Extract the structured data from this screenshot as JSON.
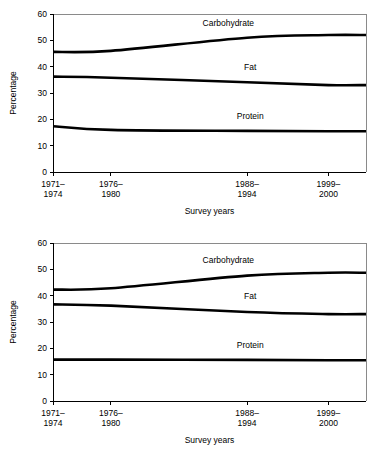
{
  "chart_data": [
    {
      "type": "line",
      "title": "",
      "xlabel": "Survey years",
      "ylabel": "Percentage",
      "ylim": [
        0,
        60
      ],
      "yticks": [
        0,
        10,
        20,
        30,
        40,
        50,
        60
      ],
      "ytick_labels": [
        "0",
        "10",
        "20",
        "30",
        "40",
        "50",
        "60"
      ],
      "categories": [
        "1971–\n1974",
        "1976–\n1980",
        "1988–\n1994",
        "1999–\n2000"
      ],
      "xtick_labels": [
        [
          "1971–",
          "1974"
        ],
        [
          "1976–",
          "1980"
        ],
        [
          "1988–",
          "1994"
        ],
        [
          "1999–",
          "2000"
        ]
      ],
      "x_positions": [
        0.0,
        0.185,
        0.62,
        0.88
      ],
      "grid": false,
      "legend_position": "inline-annotations",
      "series": [
        {
          "name": "Carbohydrate",
          "values": [
            45.6,
            46.0,
            51.0,
            52.0
          ],
          "label": "Carbohydrate",
          "label_x": 0.56,
          "label_y": 55.5
        },
        {
          "name": "Fat",
          "values": [
            36.2,
            35.8,
            34.1,
            33.0
          ],
          "label": "Fat",
          "label_x": 0.63,
          "label_y": 38.6
        },
        {
          "name": "Protein",
          "values": [
            17.4,
            16.0,
            15.6,
            15.5
          ],
          "label": "Protein",
          "label_x": 0.63,
          "label_y": 20.2
        }
      ]
    },
    {
      "type": "line",
      "title": "",
      "xlabel": "Survey years",
      "ylabel": "Percentage",
      "ylim": [
        0,
        60
      ],
      "yticks": [
        0,
        10,
        20,
        30,
        40,
        50,
        60
      ],
      "ytick_labels": [
        "0",
        "10",
        "20",
        "30",
        "40",
        "50",
        "60"
      ],
      "categories": [
        "1971–\n1974",
        "1976–\n1980",
        "1988–\n1994",
        "1999–\n2000"
      ],
      "xtick_labels": [
        [
          "1971–",
          "1974"
        ],
        [
          "1976–",
          "1980"
        ],
        [
          "1988–",
          "1994"
        ],
        [
          "1999–",
          "2000"
        ]
      ],
      "x_positions": [
        0.0,
        0.185,
        0.62,
        0.88
      ],
      "grid": false,
      "legend_position": "inline-annotations",
      "series": [
        {
          "name": "Carbohydrate",
          "values": [
            42.3,
            42.8,
            47.6,
            48.7
          ],
          "label": "Carbohydrate",
          "label_x": 0.56,
          "label_y": 52.3
        },
        {
          "name": "Fat",
          "values": [
            36.7,
            36.2,
            33.8,
            33.0
          ],
          "label": "Fat",
          "label_x": 0.63,
          "label_y": 38.6
        },
        {
          "name": "Protein",
          "values": [
            15.7,
            15.7,
            15.6,
            15.5
          ],
          "label": "Protein",
          "label_x": 0.63,
          "label_y": 20.2
        }
      ]
    }
  ],
  "colors": {
    "line": "#000000",
    "frame": "#8a8a8a",
    "axis": "#000000",
    "background": "#ffffff"
  }
}
